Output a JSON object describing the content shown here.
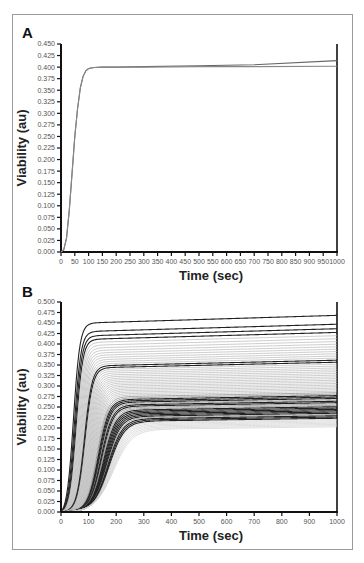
{
  "chart_data": [
    {
      "panel": "A",
      "type": "line",
      "title": "",
      "xlabel": "Time (sec)",
      "ylabel": "Viability (au)",
      "xlim": [
        0,
        1000
      ],
      "ylim": [
        0,
        0.45
      ],
      "xticks": [
        0,
        50,
        100,
        150,
        200,
        250,
        300,
        350,
        400,
        450,
        500,
        550,
        600,
        650,
        700,
        750,
        800,
        850,
        900,
        950,
        1000
      ],
      "yticks": [
        "0.000",
        "0.025",
        "0.050",
        "0.075",
        "0.100",
        "0.125",
        "0.150",
        "0.175",
        "0.200",
        "0.225",
        "0.250",
        "0.275",
        "0.300",
        "0.325",
        "0.350",
        "0.375",
        "0.400",
        "0.425",
        "0.450"
      ],
      "grid": false,
      "series": [
        {
          "name": "curve-1",
          "x": [
            0,
            10,
            20,
            30,
            40,
            50,
            60,
            70,
            80,
            90,
            100,
            120,
            150,
            200,
            300,
            500,
            700,
            1000
          ],
          "values": [
            0,
            0.005,
            0.03,
            0.09,
            0.17,
            0.25,
            0.31,
            0.355,
            0.38,
            0.392,
            0.397,
            0.399,
            0.4,
            0.4,
            0.401,
            0.403,
            0.405,
            0.414
          ]
        },
        {
          "name": "curve-2",
          "x": [
            0,
            10,
            20,
            30,
            40,
            50,
            60,
            70,
            80,
            90,
            100,
            120,
            150,
            200,
            300,
            500,
            700,
            1000
          ],
          "values": [
            0,
            0.005,
            0.03,
            0.09,
            0.17,
            0.25,
            0.31,
            0.355,
            0.38,
            0.392,
            0.397,
            0.399,
            0.4,
            0.4,
            0.4,
            0.401,
            0.401,
            0.402
          ]
        }
      ]
    },
    {
      "panel": "B",
      "type": "line",
      "title": "",
      "xlabel": "Time (sec)",
      "ylabel": "Viability (au)",
      "xlim": [
        0,
        1000
      ],
      "ylim": [
        0,
        0.5
      ],
      "xticks": [
        0,
        100,
        200,
        300,
        400,
        500,
        600,
        700,
        800,
        900,
        1000
      ],
      "yticks": [
        "0.000",
        "0.025",
        "0.050",
        "0.075",
        "0.100",
        "0.125",
        "0.150",
        "0.175",
        "0.200",
        "0.225",
        "0.250",
        "0.275",
        "0.300",
        "0.325",
        "0.350",
        "0.375",
        "0.400",
        "0.425",
        "0.450",
        "0.475",
        "0.500"
      ],
      "grid": false,
      "description": "Family of ~60 sigmoidal viability curves; plateau values range from ~0.195 to ~0.458, with slower-rising curves plateauing lower. Plateaus drift slightly upward toward t=1000.",
      "series_summary": {
        "count": 60,
        "plateau_min": 0.195,
        "plateau_max": 0.458,
        "end_min": 0.2,
        "end_max": 0.478,
        "rise_midpoint_min_sec": 45,
        "rise_midpoint_max_sec": 190,
        "highlighted_plateaus": [
          0.458,
          0.438,
          0.425,
          0.412,
          0.345,
          0.262,
          0.252,
          0.238,
          0.228,
          0.218
        ]
      }
    }
  ],
  "panels": {
    "a_label": "A",
    "b_label": "B"
  }
}
